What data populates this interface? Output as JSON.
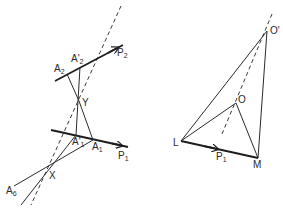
{
  "figure": {
    "left_diagram": {
      "lines": {
        "p2": {
          "label": "P",
          "sub": "2"
        },
        "p1": {
          "label": "P",
          "sub": "1"
        }
      },
      "points": {
        "a2": {
          "label": "A",
          "sub": "2"
        },
        "a2_prime": {
          "label": "A'",
          "sub": "2"
        },
        "y": {
          "label": "Y",
          "sub": ""
        },
        "a1_prime": {
          "label": "A'",
          "sub": "1"
        },
        "a1": {
          "label": "A",
          "sub": "1"
        },
        "x": {
          "label": "X",
          "sub": ""
        },
        "a6": {
          "label": "A",
          "sub": "6"
        }
      }
    },
    "right_diagram": {
      "lines": {
        "p1": {
          "label": "P",
          "sub": "1"
        }
      },
      "points": {
        "o_prime": {
          "label": "O'",
          "sub": ""
        },
        "o": {
          "label": "O",
          "sub": ""
        },
        "l": {
          "label": "L",
          "sub": ""
        },
        "m": {
          "label": "M",
          "sub": ""
        }
      }
    },
    "colors": {
      "ink": "#2a2a2a",
      "background": "#ffffff"
    }
  }
}
